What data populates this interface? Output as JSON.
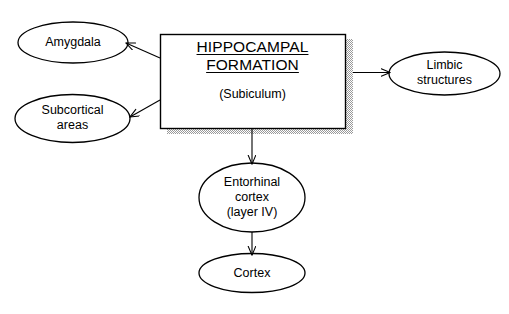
{
  "diagram": {
    "type": "flow-diagram",
    "colors": {
      "stroke": "#000000",
      "text": "#000000",
      "shadow": "#b5b5b5",
      "background": "#ffffff"
    },
    "central_box": {
      "title_line_1": "HIPPOCAMPAL",
      "title_line_2": "FORMATION",
      "subtitle": "(Subiculum)",
      "shape": "rectangle",
      "has_drop_shadow": true
    },
    "nodes": [
      {
        "id": "amygdala",
        "shape": "ellipse",
        "line_1": "Amygdala",
        "line_2": ""
      },
      {
        "id": "subcortical",
        "shape": "ellipse",
        "line_1": "Subcortical",
        "line_2": "areas"
      },
      {
        "id": "limbic",
        "shape": "ellipse",
        "line_1": "Limbic",
        "line_2": "structures"
      },
      {
        "id": "entorhinal",
        "shape": "ellipse",
        "line_1": "Entorhinal",
        "line_2": "cortex",
        "line_3": "(layer IV)"
      },
      {
        "id": "cortex",
        "shape": "ellipse",
        "line_1": "Cortex",
        "line_2": ""
      }
    ],
    "arrows": [
      {
        "id": "arrow-to-amygdala",
        "from": "central_box",
        "to": "amygdala",
        "direction": "up-left"
      },
      {
        "id": "arrow-to-subcortical",
        "from": "central_box",
        "to": "subcortical",
        "direction": "down-left"
      },
      {
        "id": "arrow-to-limbic",
        "from": "central_box",
        "to": "limbic",
        "direction": "right"
      },
      {
        "id": "arrow-to-entorhinal",
        "from": "central_box",
        "to": "entorhinal",
        "direction": "down"
      },
      {
        "id": "arrow-to-cortex",
        "from": "entorhinal",
        "to": "cortex",
        "direction": "down"
      }
    ]
  }
}
